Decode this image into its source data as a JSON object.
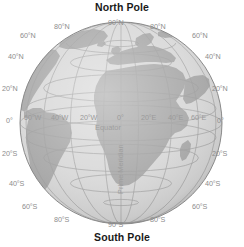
{
  "figure": {
    "name": "globe-graticule-diagram",
    "background_color": "#ffffff",
    "ocean_color": "#d7d7d7",
    "land_color": "#a6a6a6",
    "graticule_color": "#9b9b9b",
    "outline_color": "#8a8a8a",
    "label_color": "#8d8d8d",
    "title_color": "#1a1a1a"
  },
  "titles": {
    "north_pole": "North Pole",
    "south_pole": "South Pole"
  },
  "features": {
    "equator": "Equator",
    "prime_meridian": "Prime Meridian"
  },
  "latitude_labels_left": [
    {
      "text": "60°N",
      "x": 20,
      "y": 32
    },
    {
      "text": "40°N",
      "x": 8,
      "y": 53
    },
    {
      "text": "20°N",
      "x": 2,
      "y": 85
    },
    {
      "text": "0°",
      "x": 6,
      "y": 117
    },
    {
      "text": "20°S",
      "x": 2,
      "y": 150
    },
    {
      "text": "40°S",
      "x": 9,
      "y": 180
    },
    {
      "text": "60°S",
      "x": 22,
      "y": 203
    }
  ],
  "latitude_labels_right": [
    {
      "text": "60°N",
      "x": 192,
      "y": 32
    },
    {
      "text": "40°N",
      "x": 205,
      "y": 53
    },
    {
      "text": "20°N",
      "x": 212,
      "y": 85
    },
    {
      "text": "0°",
      "x": 217,
      "y": 117
    },
    {
      "text": "20°S",
      "x": 212,
      "y": 150
    },
    {
      "text": "40°S",
      "x": 205,
      "y": 180
    },
    {
      "text": "60°S",
      "x": 192,
      "y": 203
    }
  ],
  "polar_labels": [
    {
      "text": "80°N",
      "x": 54,
      "y": 23
    },
    {
      "text": "90°N",
      "x": 108,
      "y": 19
    },
    {
      "text": "80°N",
      "x": 150,
      "y": 23
    },
    {
      "text": "80°S",
      "x": 54,
      "y": 216
    },
    {
      "text": "90°S",
      "x": 108,
      "y": 221
    },
    {
      "text": "80°S",
      "x": 150,
      "y": 216
    }
  ],
  "longitude_labels": [
    {
      "text": "60°W",
      "x": 24,
      "y": 114
    },
    {
      "text": "40°W",
      "x": 51,
      "y": 114
    },
    {
      "text": "20°W",
      "x": 80,
      "y": 114
    },
    {
      "text": "0°",
      "x": 117,
      "y": 114
    },
    {
      "text": "20°E",
      "x": 141,
      "y": 114
    },
    {
      "text": "40°E",
      "x": 168,
      "y": 114
    },
    {
      "text": "60°E",
      "x": 191,
      "y": 114
    }
  ],
  "geometry": {
    "center_x": 121,
    "center_y": 123,
    "radius": 101,
    "parallels_deg": [
      80,
      60,
      40,
      20,
      0,
      -20,
      -40,
      -60,
      -80
    ],
    "meridians_deg": [
      -80,
      -60,
      -40,
      -20,
      0,
      20,
      40,
      60,
      80
    ]
  }
}
